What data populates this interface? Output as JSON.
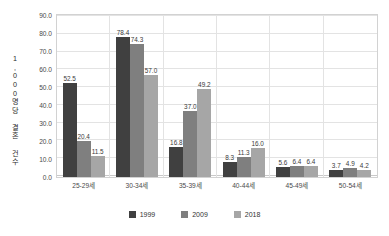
{
  "chart_data": {
    "type": "bar",
    "title": "",
    "subtitle": "",
    "xlabel": "",
    "ylabel": "1,000명당 결혼 건수",
    "categories": [
      "25-29세",
      "30-34세",
      "35-39세",
      "40-44세",
      "45-49세",
      "50-54세"
    ],
    "series": [
      {
        "name": "1999",
        "color": "#404040",
        "values": [
          52.5,
          78.4,
          16.8,
          8.3,
          5.6,
          3.7
        ]
      },
      {
        "name": "2009",
        "color": "#7f7f7f",
        "values": [
          20.4,
          74.3,
          37.0,
          11.3,
          6.4,
          4.9
        ]
      },
      {
        "name": "2018",
        "color": "#a6a6a6",
        "values": [
          11.5,
          57.0,
          49.2,
          16.0,
          6.4,
          4.2
        ]
      }
    ],
    "value_labels": [
      [
        "52.5",
        "20.4",
        "11.5"
      ],
      [
        "78.4",
        "74.3",
        "57.0"
      ],
      [
        "16.8",
        "37.0",
        "49.2"
      ],
      [
        "8.3",
        "11.3",
        "16.0"
      ],
      [
        "5.6",
        "6.4",
        "6.4"
      ],
      [
        "3.7",
        "4.9",
        "4.2"
      ]
    ],
    "ylim": [
      0.0,
      90.0
    ],
    "ytick_step": 10.0,
    "yticks": [
      "90.0",
      "80.0",
      "70.0",
      "60.0",
      "50.0",
      "40.0",
      "30.0",
      "20.0",
      "10.0",
      "0.0"
    ],
    "grid": true,
    "legend_position": "bottom",
    "legend": [
      "1999",
      "2009",
      "2018"
    ]
  },
  "style": {
    "background": "#ffffff",
    "gridline_color": "#e3e3e3",
    "frame_color": "#d2d2d2",
    "tick_text_color": "#4a4a4a",
    "value_text_color": "#3a3a3a"
  }
}
